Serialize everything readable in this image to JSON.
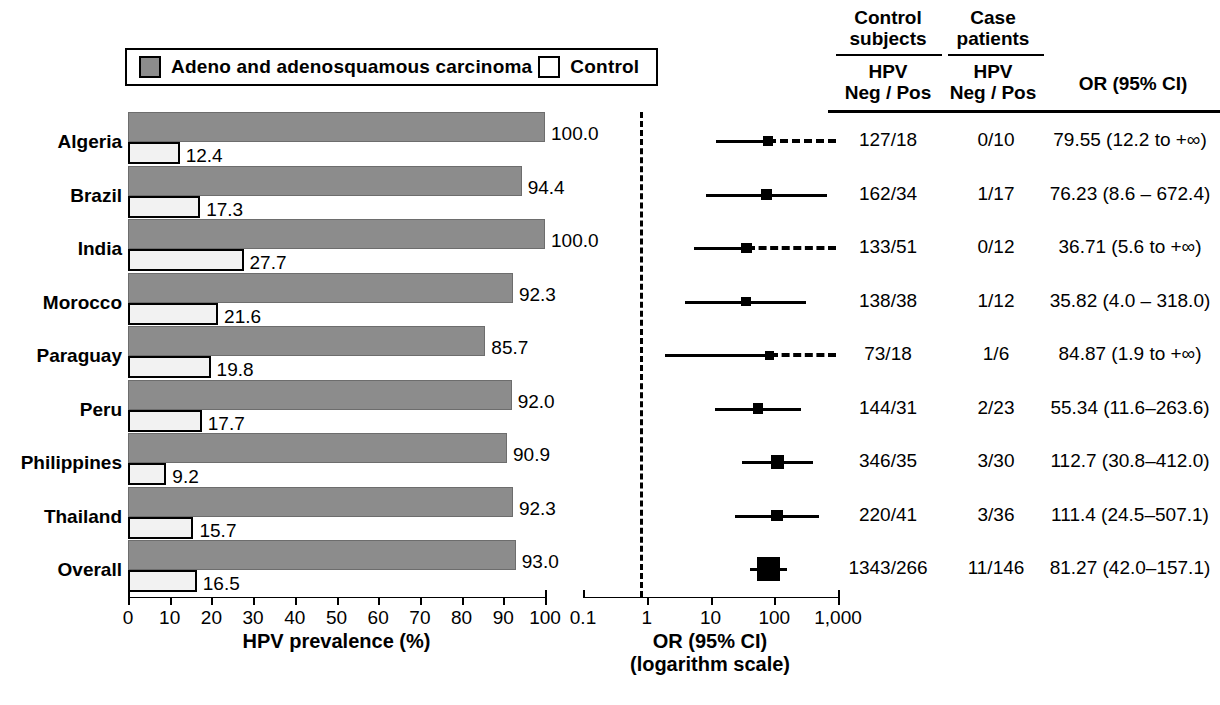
{
  "legend": {
    "case_swatch_label": "Adeno and  adenosquamous    carcinoma",
    "control_label": "Control"
  },
  "axes": {
    "bar_title": "HPV prevalence (%)",
    "bar_ticks": [
      "0",
      "10",
      "20",
      "30",
      "40",
      "50",
      "60",
      "70",
      "80",
      "90",
      "100"
    ],
    "forest_title_line1": "OR (95% CI)",
    "forest_title_line2": "(logarithm scale)",
    "forest_ticks": [
      "0.1",
      "1",
      "10",
      "100",
      "1,000"
    ]
  },
  "table": {
    "header_control": "Control",
    "header_control_sub": "subjects",
    "header_case": "Case",
    "header_case_sub": "patients",
    "header_hpv_control": "HPV",
    "header_negpos_control": "Neg / Pos",
    "header_hpv_case": "HPV",
    "header_negpos_case": "Neg / Pos",
    "header_or": "OR (95% CI)"
  },
  "chart_data": {
    "type": "bar",
    "xlabel": "HPV prevalence (%)",
    "ylabel": "",
    "xlim": [
      0,
      100
    ],
    "grid": false,
    "legend_position": "top",
    "categories": [
      "Algeria",
      "Brazil",
      "India",
      "Morocco",
      "Paraguay",
      "Peru",
      "Philippines",
      "Thailand",
      "Overall"
    ],
    "series": [
      {
        "name": "Adeno and adenosquamous carcinoma",
        "values": [
          100.0,
          94.4,
          100.0,
          92.3,
          85.7,
          92.0,
          90.9,
          92.3,
          93.0
        ]
      },
      {
        "name": "Control",
        "values": [
          12.4,
          17.3,
          27.7,
          21.6,
          19.8,
          17.7,
          9.2,
          15.7,
          16.5
        ]
      }
    ],
    "forest": {
      "type": "forest",
      "xlabel": "OR (95% CI) (logarithm scale)",
      "xscale": "log",
      "xlim": [
        0.1,
        1000
      ],
      "reference_line": 1,
      "rows": [
        {
          "country": "Algeria",
          "or": 79.55,
          "lo": 12.2,
          "hi": null,
          "hi_infinite": true,
          "control_negpos": "127/18",
          "case_negpos": "0/10",
          "or_text": "79.55 (12.2 to +∞)",
          "weight": 1
        },
        {
          "country": "Brazil",
          "or": 76.23,
          "lo": 8.6,
          "hi": 672.4,
          "hi_infinite": false,
          "control_negpos": "162/34",
          "case_negpos": "1/17",
          "or_text": "76.23 (8.6 – 672.4)",
          "weight": 1.2
        },
        {
          "country": "India",
          "or": 36.71,
          "lo": 5.6,
          "hi": null,
          "hi_infinite": true,
          "control_negpos": "133/51",
          "case_negpos": "0/12",
          "or_text": "36.71 (5.6 to +∞)",
          "weight": 1.1
        },
        {
          "country": "Morocco",
          "or": 35.82,
          "lo": 4.0,
          "hi": 318.0,
          "hi_infinite": false,
          "control_negpos": "138/38",
          "case_negpos": "1/12",
          "or_text": "35.82 (4.0 – 318.0)",
          "weight": 1
        },
        {
          "country": "Paraguay",
          "or": 84.87,
          "lo": 1.9,
          "hi": null,
          "hi_infinite": true,
          "control_negpos": "73/18",
          "case_negpos": "1/6",
          "or_text": "84.87 (1.9 to +∞)",
          "weight": 0.9
        },
        {
          "country": "Peru",
          "or": 55.34,
          "lo": 11.6,
          "hi": 263.6,
          "hi_infinite": false,
          "control_negpos": "144/31",
          "case_negpos": "2/23",
          "or_text": "55.34 (11.6–263.6)",
          "weight": 1.1
        },
        {
          "country": "Philippines",
          "or": 112.7,
          "lo": 30.8,
          "hi": 412.0,
          "hi_infinite": false,
          "control_negpos": "346/35",
          "case_negpos": "3/30",
          "or_text": "112.7 (30.8–412.0)",
          "weight": 1.5
        },
        {
          "country": "Thailand",
          "or": 111.4,
          "lo": 24.5,
          "hi": 507.1,
          "hi_infinite": false,
          "control_negpos": "220/41",
          "case_negpos": "3/36",
          "or_text": "111.4 (24.5–507.1)",
          "weight": 1.3
        },
        {
          "country": "Overall",
          "or": 81.27,
          "lo": 42.0,
          "hi": 157.1,
          "hi_infinite": false,
          "control_negpos": "1343/266",
          "case_negpos": "11/146",
          "or_text": "81.27 (42.0–157.1)",
          "weight": 3.0
        }
      ]
    }
  }
}
